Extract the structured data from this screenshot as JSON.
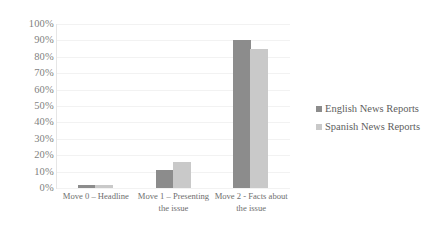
{
  "chart_data": {
    "type": "bar",
    "title": "",
    "xlabel": "",
    "ylabel": "",
    "ylim": [
      0,
      100
    ],
    "grid": true,
    "legend_position": "right",
    "categories": [
      "Move 0 – Headline",
      "Move 1 – Presenting the issue",
      "Move 2 - Facts about the issue"
    ],
    "ytick_labels": [
      "100%",
      "90%",
      "80%",
      "70%",
      "60%",
      "50%",
      "40%",
      "30%",
      "20%",
      "10%",
      "0%"
    ],
    "ytick_values": [
      100,
      90,
      80,
      70,
      60,
      50,
      40,
      30,
      20,
      10,
      0
    ],
    "series": [
      {
        "name": "English News Reports",
        "color": "#8c8c8c",
        "values": [
          2,
          11,
          90
        ]
      },
      {
        "name": "Spanish News Reports",
        "color": "#c9c9c9",
        "values": [
          2,
          16,
          85
        ]
      }
    ]
  }
}
